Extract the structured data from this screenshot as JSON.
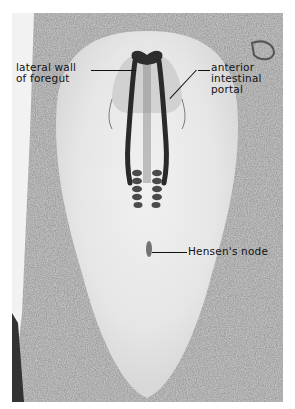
{
  "figure": {
    "labels": [
      {
        "id": "lateral-wall-of-foregut",
        "lines": [
          "lateral wall",
          "of foregut"
        ]
      },
      {
        "id": "anterior-intestinal-portal",
        "lines": [
          "anterior",
          "intestinal",
          "portal"
        ]
      },
      {
        "id": "hensens-node",
        "lines": [
          "Hensen's node"
        ]
      }
    ]
  }
}
